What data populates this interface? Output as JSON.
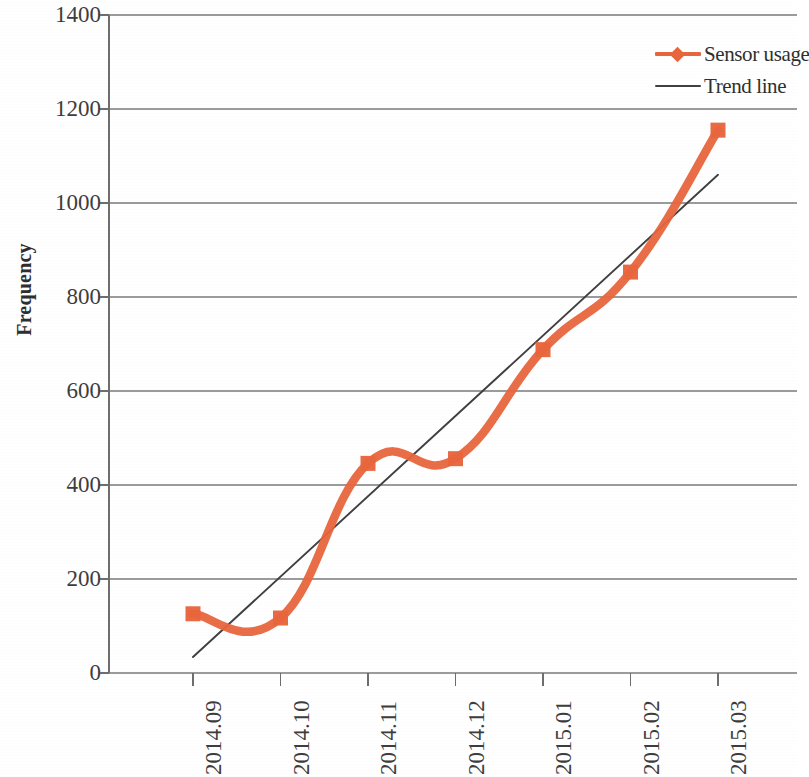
{
  "chart_data": {
    "type": "line",
    "title": "",
    "subtitle": "",
    "xlabel": "",
    "ylabel": "Frequency",
    "categories": [
      "2014.09",
      "2014.10",
      "2014.11",
      "2014.12",
      "2015.01",
      "2015.02",
      "2015.03"
    ],
    "series": [
      {
        "name": "Sensor usage",
        "type": "line",
        "color": "#E8663D",
        "marker": "square",
        "values": [
          126,
          117,
          446,
          456,
          688,
          853,
          1155
        ]
      },
      {
        "name": "Trend line",
        "type": "trendline",
        "color": "#3f3f3f",
        "marker": "none",
        "endpoints": [
          34,
          1060
        ],
        "values": [
          34,
          205,
          376,
          547,
          718,
          889,
          1060
        ]
      }
    ],
    "ylim": [
      0,
      1400
    ],
    "yticks": [
      0,
      200,
      400,
      600,
      800,
      1000,
      1200,
      1400
    ],
    "ytick_labels": [
      "0",
      "200",
      "400",
      "600",
      "800",
      "1000",
      "1200",
      "1400"
    ],
    "grid": true,
    "grid_axis": "y",
    "legend_position": "top-right",
    "legend_entries": [
      "Sensor usage",
      "Trend line"
    ]
  },
  "axes": {
    "y_title": "Frequency",
    "y_tick_labels": [
      "1400",
      "1200",
      "1000",
      "800",
      "600",
      "400",
      "200",
      "0"
    ],
    "x_tick_labels": [
      "2014.09",
      "2014.10",
      "2014.11",
      "2014.12",
      "2015.01",
      "2015.02",
      "2015.03"
    ]
  },
  "legend": {
    "items": [
      {
        "label": "Sensor usage",
        "color": "#E8663D",
        "style": "line-marker"
      },
      {
        "label": "Trend line",
        "color": "#404040",
        "style": "line"
      }
    ]
  },
  "colors": {
    "sensor_usage": "#E8663D",
    "trendline": "#404040",
    "gridline": "#8a8a8a",
    "axis": "#6e6e6e",
    "text": "#3d3d3d",
    "background": "#ffffff"
  }
}
